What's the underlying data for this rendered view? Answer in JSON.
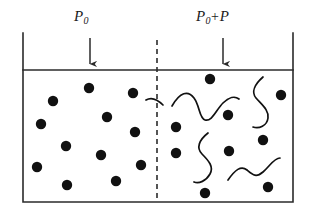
{
  "figure": {
    "name": "osmotic-pressure-diagram",
    "width": 311,
    "height": 214,
    "background_color": "#ffffff",
    "stroke_color": "#2b2b2b",
    "particle_color": "#111111"
  },
  "labels": {
    "left_pressure": {
      "base": "P",
      "subscript": "0",
      "full_text": "P0"
    },
    "right_pressure": {
      "base": "P",
      "subscript": "0",
      "operator": "+",
      "addend": "P",
      "full_text": "P0+P"
    }
  },
  "container": {
    "left_wall_x": 23,
    "right_wall_x": 293,
    "top_y": 33,
    "bottom_y": 202,
    "surface_y": 70,
    "line_width": 1.6
  },
  "membrane": {
    "name": "dashed-divider",
    "x": 157,
    "top_y": 40,
    "bottom_y": 202,
    "dash_pattern": "5,4",
    "line_width": 1.6
  },
  "arrows": [
    {
      "name": "left-pressure-arrow",
      "x": 90,
      "y_start": 38,
      "y_end": 70
    },
    {
      "name": "right-pressure-arrow",
      "x": 223,
      "y_start": 38,
      "y_end": 70
    }
  ],
  "compartments": {
    "left": {
      "name": "solvent-compartment",
      "particle_count": 12,
      "chain_count": 0,
      "particles": [
        {
          "cx": 89,
          "cy": 88,
          "r": 5.2
        },
        {
          "cx": 53,
          "cy": 101,
          "r": 5.2
        },
        {
          "cx": 133,
          "cy": 93,
          "r": 5.2
        },
        {
          "cx": 107,
          "cy": 117,
          "r": 5.2
        },
        {
          "cx": 41,
          "cy": 124,
          "r": 5.2
        },
        {
          "cx": 66,
          "cy": 146,
          "r": 5.2
        },
        {
          "cx": 135,
          "cy": 132,
          "r": 5.2
        },
        {
          "cx": 101,
          "cy": 155,
          "r": 5.2
        },
        {
          "cx": 37,
          "cy": 167,
          "r": 5.2
        },
        {
          "cx": 141,
          "cy": 165,
          "r": 5.2
        },
        {
          "cx": 67,
          "cy": 185,
          "r": 5.2
        },
        {
          "cx": 116,
          "cy": 181,
          "r": 5.2
        }
      ]
    },
    "right": {
      "name": "polymer-solution-compartment",
      "particle_count": 9,
      "chain_count": 5,
      "particles": [
        {
          "cx": 210,
          "cy": 79,
          "r": 5.2
        },
        {
          "cx": 281,
          "cy": 95,
          "r": 5.2
        },
        {
          "cx": 228,
          "cy": 115,
          "r": 5.2
        },
        {
          "cx": 176,
          "cy": 127,
          "r": 5.2
        },
        {
          "cx": 263,
          "cy": 140,
          "r": 5.2
        },
        {
          "cx": 176,
          "cy": 153,
          "r": 5.2
        },
        {
          "cx": 229,
          "cy": 151,
          "r": 5.2
        },
        {
          "cx": 205,
          "cy": 193,
          "r": 5.2
        },
        {
          "cx": 268,
          "cy": 187,
          "r": 5.2
        }
      ],
      "chains": [
        {
          "name": "polymer-chain-1",
          "path": "M 172 106 C 180 92, 188 90, 194 98 C 200 106, 199 118, 205 120 C 212 122, 216 110, 223 103 C 229 97, 235 96, 239 99"
        },
        {
          "name": "polymer-chain-2",
          "path": "M 263 77 C 255 84, 251 92, 256 98 C 262 105, 269 110, 268 118 C 267 126, 259 129, 253 127"
        },
        {
          "name": "polymer-chain-3",
          "path": "M 208 133 C 199 140, 196 148, 202 154 C 209 161, 214 167, 210 174 C 206 181, 199 184, 194 182"
        },
        {
          "name": "polymer-chain-4",
          "path": "M 228 180 C 235 170, 241 165, 247 170 C 253 175, 256 178, 263 172 C 270 166, 274 158, 280 158"
        },
        {
          "name": "polymer-chain-5",
          "path": "M 163 105 C 157 99, 151 97, 146 100"
        }
      ]
    }
  }
}
